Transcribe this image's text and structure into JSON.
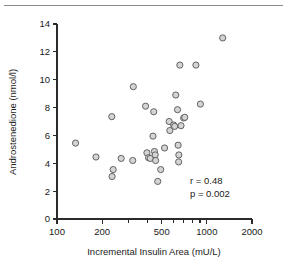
{
  "chart_data": {
    "type": "scatter",
    "title": "",
    "xlabel": "Incremental Insulin Area (mU/L)",
    "ylabel": "Androstenedione (nmol/l)",
    "xscale": "log",
    "yscale": "linear",
    "xlim": [
      100,
      2000
    ],
    "ylim": [
      0,
      14
    ],
    "xticks": [
      100,
      200,
      500,
      1000,
      2000
    ],
    "xtick_labels": [
      "100",
      "200",
      "500",
      "1000",
      "2000"
    ],
    "xminor_ticks": [
      300,
      400,
      600,
      700,
      800,
      900
    ],
    "yticks": [
      0,
      2,
      4,
      6,
      8,
      10,
      12,
      14
    ],
    "ytick_labels": [
      "0",
      "2",
      "4",
      "6",
      "8",
      "10",
      "12",
      "14"
    ],
    "grid": false,
    "legend": null,
    "marker": "open-circle",
    "marker_fill": "#d4d4d4",
    "marker_edge": "#555555",
    "points": [
      {
        "x": 133,
        "y": 5.45
      },
      {
        "x": 182,
        "y": 4.45
      },
      {
        "x": 232,
        "y": 7.35
      },
      {
        "x": 237,
        "y": 3.55
      },
      {
        "x": 233,
        "y": 3.05
      },
      {
        "x": 268,
        "y": 4.35
      },
      {
        "x": 323,
        "y": 9.5
      },
      {
        "x": 320,
        "y": 4.2
      },
      {
        "x": 390,
        "y": 8.1
      },
      {
        "x": 398,
        "y": 4.75
      },
      {
        "x": 408,
        "y": 4.4
      },
      {
        "x": 419,
        "y": 4.35
      },
      {
        "x": 442,
        "y": 7.7
      },
      {
        "x": 437,
        "y": 5.95
      },
      {
        "x": 447,
        "y": 4.85
      },
      {
        "x": 452,
        "y": 4.6
      },
      {
        "x": 455,
        "y": 4.2
      },
      {
        "x": 470,
        "y": 2.7
      },
      {
        "x": 492,
        "y": 3.55
      },
      {
        "x": 522,
        "y": 5.1
      },
      {
        "x": 560,
        "y": 7.0
      },
      {
        "x": 566,
        "y": 6.35
      },
      {
        "x": 600,
        "y": 6.75
      },
      {
        "x": 610,
        "y": 6.65
      },
      {
        "x": 620,
        "y": 8.9
      },
      {
        "x": 637,
        "y": 7.85
      },
      {
        "x": 643,
        "y": 5.3
      },
      {
        "x": 650,
        "y": 4.6
      },
      {
        "x": 648,
        "y": 4.1
      },
      {
        "x": 660,
        "y": 11.05
      },
      {
        "x": 672,
        "y": 6.7
      },
      {
        "x": 700,
        "y": 7.25
      },
      {
        "x": 712,
        "y": 7.3
      },
      {
        "x": 845,
        "y": 11.05
      },
      {
        "x": 905,
        "y": 8.25
      },
      {
        "x": 1275,
        "y": 13.0
      }
    ],
    "annotations": [
      {
        "text": "r  =  0.48"
      },
      {
        "text": "p  =  0.002"
      }
    ]
  },
  "plot_geometry": {
    "x_pixel_min": 57,
    "x_pixel_max": 252,
    "y_pixel_zero": 219,
    "y_pixel_max": 24
  }
}
